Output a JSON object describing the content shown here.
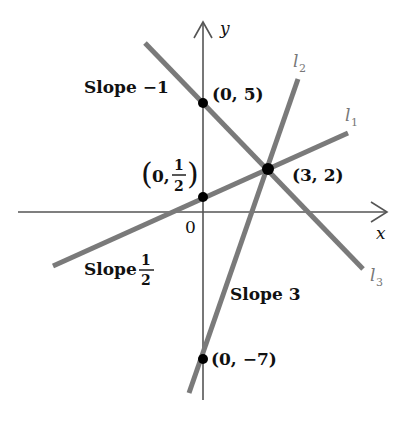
{
  "diagram": {
    "title": "",
    "axes": {
      "x_label": "x",
      "y_label": "y",
      "origin_label": "0"
    },
    "lines": [
      {
        "id": "l1",
        "name": "l",
        "subscript": "1",
        "slope_label": "Slope",
        "slope_value": "1/2",
        "slope_num": "1",
        "slope_den": "2",
        "y_intercept": "(0, 1/2)"
      },
      {
        "id": "l2",
        "name": "l",
        "subscript": "2",
        "slope_label": "Slope 3",
        "slope_value": "3",
        "y_intercept": "(0, −7)"
      },
      {
        "id": "l3",
        "name": "l",
        "subscript": "3",
        "slope_label": "Slope −1",
        "slope_value": "−1",
        "y_intercept": "(0, 5)"
      }
    ],
    "points": [
      {
        "label": "(0, 5)"
      },
      {
        "label_open": "(0, ",
        "frac_num": "1",
        "frac_den": "2",
        "label_close": ")"
      },
      {
        "label": "(3, 2)"
      },
      {
        "label": "(0, −7)"
      }
    ],
    "colors": {
      "line": "#7a7a7a",
      "axis": "#555555",
      "point": "#000000",
      "text": "#111111"
    }
  }
}
